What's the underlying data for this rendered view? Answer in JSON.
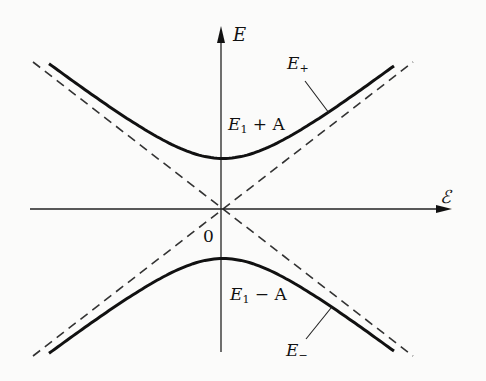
{
  "diagram": {
    "axes": {
      "y_label": "E",
      "x_label": "ℰ",
      "origin_label": "0"
    },
    "curves": {
      "upper": {
        "name": "E",
        "sub": "+",
        "label_main": "E",
        "label_sub": "1",
        "label_rest": " + A"
      },
      "lower": {
        "name": "E",
        "sub": "−",
        "label_main": "E",
        "label_sub": "1",
        "label_rest": " − A"
      }
    },
    "asymptotes": "dashed lines through origin",
    "colors": {
      "ink": "#111111",
      "background": "#fbfbfa"
    }
  }
}
